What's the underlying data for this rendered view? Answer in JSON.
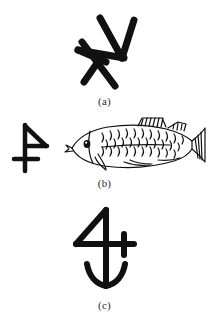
{
  "figure": {
    "background_color": "#ffffff",
    "ink_color": "#111111",
    "caption_color": "#2b2b2b",
    "panels": [
      {
        "id": "a",
        "caption": "(a)",
        "content_description": "brushed pictographic glyph, angular crossed strokes",
        "items": [
          {
            "name": "glyph-a",
            "kind": "glyph"
          }
        ]
      },
      {
        "id": "b",
        "caption": "(b)",
        "content_description": "pictographic glyph beside a line drawing of a fish",
        "items": [
          {
            "name": "glyph-b",
            "kind": "glyph"
          },
          {
            "name": "fish-illustration",
            "kind": "illustration"
          }
        ]
      },
      {
        "id": "c",
        "caption": "(c)",
        "content_description": "pictographic glyph resembling a numeral four with a cross finial and downward arrow",
        "items": [
          {
            "name": "glyph-c",
            "kind": "glyph"
          }
        ]
      }
    ]
  }
}
